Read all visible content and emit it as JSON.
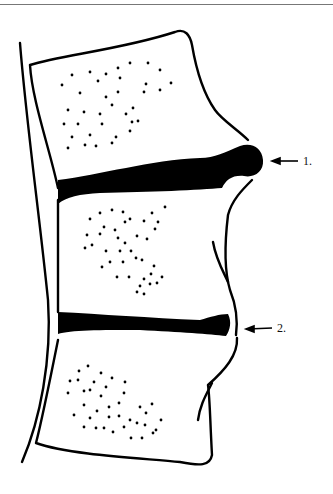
{
  "figure": {
    "labels": [
      {
        "id": "1",
        "text": "1.",
        "target": "posterior disc bulge / herniation"
      },
      {
        "id": "2",
        "text": "2.",
        "target": "disc at lower level"
      }
    ],
    "colors": {
      "ink": "#000000",
      "background": "#ffffff",
      "rule": "#777777"
    }
  }
}
